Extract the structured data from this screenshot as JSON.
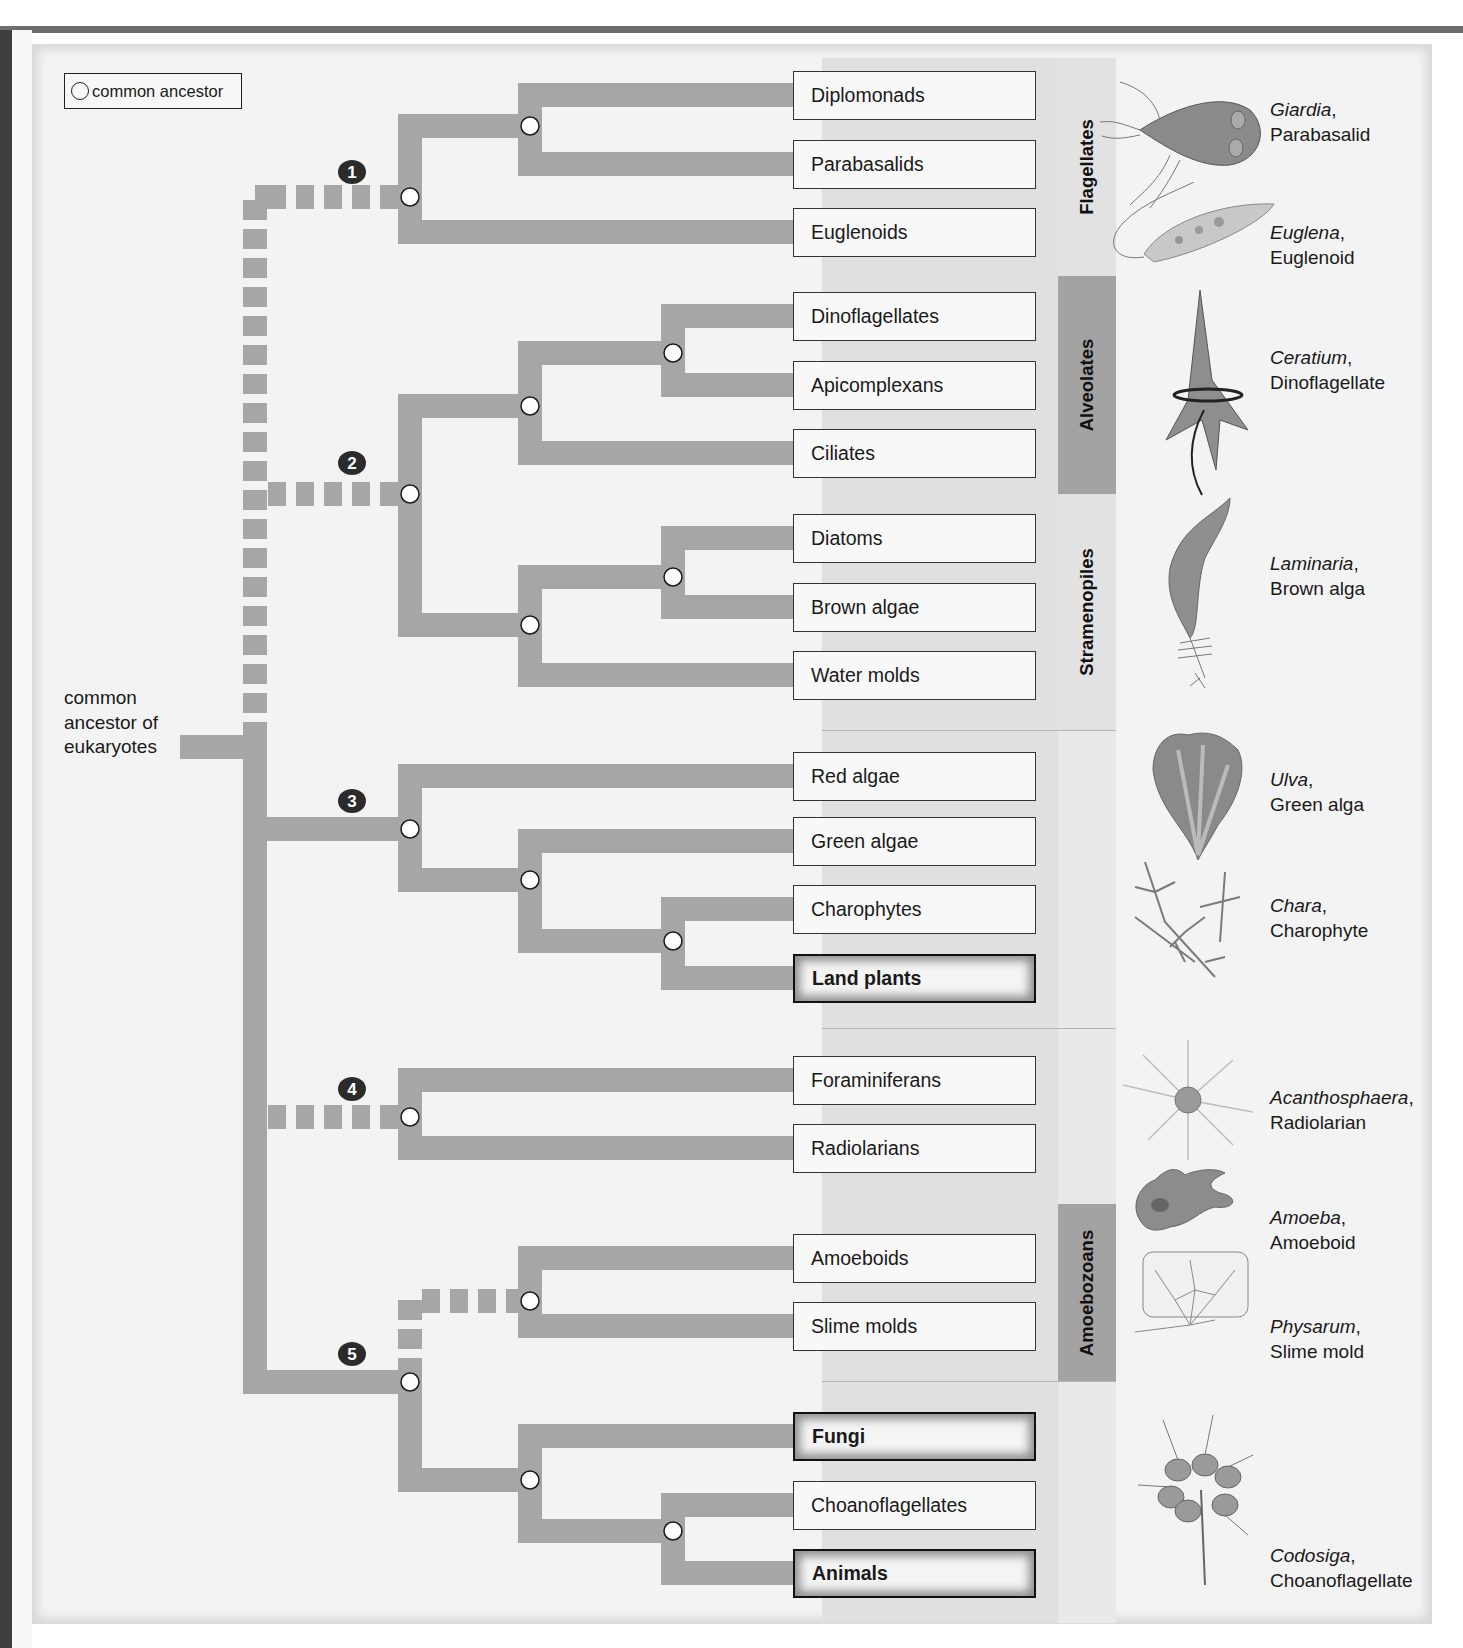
{
  "legend": {
    "label": "common ancestor",
    "icon": "open-circle-icon"
  },
  "root": {
    "label_lines": [
      "common",
      "ancestor of",
      "eukaryotes"
    ]
  },
  "colors": {
    "branch": "#a6a6a6",
    "node_fill": "#ffffff",
    "node_stroke": "#1a1a1a",
    "badge": "#2b2b2b",
    "panel": "#f3f3f3",
    "box_border": "#333333",
    "clade_dark": "#a3a3a3",
    "clade_light": "#e2e2e2"
  },
  "taxa": [
    {
      "name": "Diplomonads",
      "bold": false,
      "y": 95
    },
    {
      "name": "Parabasalids",
      "bold": false,
      "y": 164
    },
    {
      "name": "Euglenoids",
      "bold": false,
      "y": 232
    },
    {
      "name": "Dinoflagellates",
      "bold": false,
      "y": 316
    },
    {
      "name": "Apicomplexans",
      "bold": false,
      "y": 385
    },
    {
      "name": "Ciliates",
      "bold": false,
      "y": 453
    },
    {
      "name": "Diatoms",
      "bold": false,
      "y": 538
    },
    {
      "name": "Brown algae",
      "bold": false,
      "y": 607
    },
    {
      "name": "Water molds",
      "bold": false,
      "y": 675
    },
    {
      "name": "Red algae",
      "bold": false,
      "y": 776
    },
    {
      "name": "Green algae",
      "bold": false,
      "y": 841
    },
    {
      "name": "Charophytes",
      "bold": false,
      "y": 909
    },
    {
      "name": "Land plants",
      "bold": true,
      "y": 978
    },
    {
      "name": "Foraminiferans",
      "bold": false,
      "y": 1080
    },
    {
      "name": "Radiolarians",
      "bold": false,
      "y": 1148
    },
    {
      "name": "Amoeboids",
      "bold": false,
      "y": 1258
    },
    {
      "name": "Slime molds",
      "bold": false,
      "y": 1326
    },
    {
      "name": "Fungi",
      "bold": true,
      "y": 1436
    },
    {
      "name": "Choanoflagellates",
      "bold": false,
      "y": 1505
    },
    {
      "name": "Animals",
      "bold": true,
      "y": 1573
    }
  ],
  "clades": [
    {
      "name": "Flagellates",
      "top": 58,
      "bottom": 276,
      "shade": "light"
    },
    {
      "name": "Alveolates",
      "top": 276,
      "bottom": 494,
      "shade": "dark"
    },
    {
      "name": "Stramenopiles",
      "top": 494,
      "bottom": 730,
      "shade": "light"
    },
    {
      "name": "Amoebozoans",
      "top": 1204,
      "bottom": 1381,
      "shade": "dark"
    }
  ],
  "groups": [
    {
      "number": "1",
      "badge_x": 352,
      "badge_y": 172
    },
    {
      "number": "2",
      "badge_x": 352,
      "badge_y": 463
    },
    {
      "number": "3",
      "badge_x": 352,
      "badge_y": 801
    },
    {
      "number": "4",
      "badge_x": 352,
      "badge_y": 1089
    },
    {
      "number": "5",
      "badge_x": 352,
      "badge_y": 1354
    }
  ],
  "organisms": [
    {
      "genus": "Giardia",
      "common": "Parabasalid",
      "y": 98,
      "icon": "giardia-illustration"
    },
    {
      "genus": "Euglena",
      "common": "Euglenoid",
      "y": 221,
      "icon": "euglena-illustration"
    },
    {
      "genus": "Ceratium",
      "common": "Dinoflagellate",
      "y": 346,
      "icon": "ceratium-illustration"
    },
    {
      "genus": "Laminaria",
      "common": "Brown alga",
      "y": 552,
      "icon": "laminaria-illustration"
    },
    {
      "genus": "Ulva",
      "common": "Green alga",
      "y": 768,
      "icon": "ulva-illustration"
    },
    {
      "genus": "Chara",
      "common": "Charophyte",
      "y": 894,
      "icon": "chara-illustration"
    },
    {
      "genus": "Acanthosphaera",
      "common": "Radiolarian",
      "y": 1086,
      "icon": "acanthosphaera-illustration"
    },
    {
      "genus": "Amoeba",
      "common": "Amoeboid",
      "y": 1206,
      "icon": "amoeba-illustration"
    },
    {
      "genus": "Physarum",
      "common": "Slime mold",
      "y": 1315,
      "icon": "physarum-illustration"
    },
    {
      "genus": "Codosiga",
      "common": "Choanoflagellate",
      "y": 1544,
      "icon": "codosiga-illustration"
    }
  ]
}
